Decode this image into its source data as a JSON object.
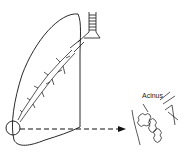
{
  "diagram": {
    "title": "",
    "labels": {
      "acinus": "Acinus"
    },
    "colors": {
      "stroke": "#111111",
      "background": "#ffffff"
    }
  }
}
